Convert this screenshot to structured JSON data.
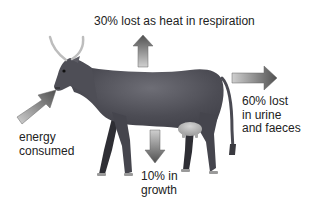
{
  "diagram": {
    "labels": {
      "heat": "30% lost as heat in respiration",
      "waste": "60% lost\nin urine\nand faeces",
      "energy": "energy\nconsumed",
      "growth": "10% in\ngrowth"
    },
    "arrows": [
      {
        "name": "energy-in",
        "direction": "up-right",
        "label_key": "energy"
      },
      {
        "name": "heat-out",
        "direction": "up",
        "label_key": "heat"
      },
      {
        "name": "waste-out",
        "direction": "right",
        "label_key": "waste"
      },
      {
        "name": "growth",
        "direction": "down",
        "label_key": "growth"
      }
    ],
    "colors": {
      "cow_body": "#4a4a52",
      "cow_highlight": "#6c6c74",
      "leg_dark": "#2e2e34",
      "horn": "#bfbfbf",
      "udder": "#b9b9b9",
      "arrow_dark": "#555555",
      "arrow_light": "#c8c8c8",
      "text": "#222222"
    }
  }
}
